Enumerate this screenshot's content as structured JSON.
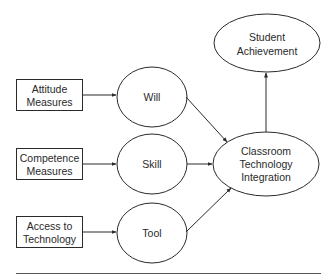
{
  "diagram": {
    "nodes": {
      "attitude": {
        "lines": [
          "Attitude",
          "Measures"
        ],
        "shape": "rectangle"
      },
      "competence": {
        "lines": [
          "Competence",
          "Measures"
        ],
        "shape": "rectangle"
      },
      "access": {
        "lines": [
          "Access to",
          "Technology"
        ],
        "shape": "rectangle"
      },
      "will": {
        "lines": [
          "Will"
        ],
        "shape": "ellipse"
      },
      "skill": {
        "lines": [
          "Skill"
        ],
        "shape": "ellipse"
      },
      "tool": {
        "lines": [
          "Tool"
        ],
        "shape": "ellipse"
      },
      "integration": {
        "lines": [
          "Classroom",
          "Technology",
          "Integration"
        ],
        "shape": "ellipse"
      },
      "achievement": {
        "lines": [
          "Student",
          "Achievement"
        ],
        "shape": "ellipse"
      }
    },
    "edges": [
      {
        "from": "Attitude Measures",
        "to": "Will"
      },
      {
        "from": "Competence Measures",
        "to": "Skill"
      },
      {
        "from": "Access to Technology",
        "to": "Tool"
      },
      {
        "from": "Will",
        "to": "Classroom Technology Integration"
      },
      {
        "from": "Skill",
        "to": "Classroom Technology Integration"
      },
      {
        "from": "Tool",
        "to": "Classroom Technology Integration"
      },
      {
        "from": "Classroom Technology Integration",
        "to": "Student Achievement"
      }
    ],
    "colors": {
      "stroke": "#2a2a2a",
      "background": "#ffffff"
    }
  }
}
